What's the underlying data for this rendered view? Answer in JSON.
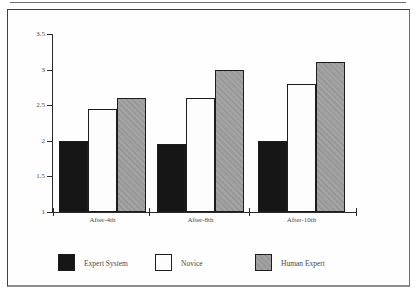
{
  "figure": {
    "background": "#fefefe",
    "frame_border_color": "#3f3f3f"
  },
  "chart_data": {
    "type": "bar",
    "title": "",
    "xlabel": "",
    "ylabel": "",
    "categories": [
      "After-4th",
      "After-8th",
      "After-10th"
    ],
    "series": [
      {
        "name": "Expert System",
        "color": "#161616",
        "values": [
          2.0,
          1.95,
          2.0
        ]
      },
      {
        "name": "Novice",
        "color": "#fdfdfd",
        "values": [
          2.45,
          2.6,
          2.8
        ]
      },
      {
        "name": "Human Expert",
        "color": "#9c9c9c",
        "values": [
          2.6,
          3.0,
          3.1
        ]
      }
    ],
    "ylim": [
      1,
      3.5
    ],
    "yticks": [
      1,
      1.5,
      2,
      2.5,
      3,
      3.5
    ],
    "ytick_labels": [
      "1",
      "1.5",
      "2",
      "2.5",
      "3",
      "3.5"
    ],
    "grid": false,
    "legend_position": "bottom"
  },
  "legend": {
    "items": [
      {
        "label": "Expert System",
        "color": "#161616"
      },
      {
        "label": "Novice",
        "color": "#fdfdfd"
      },
      {
        "label": "Human Expert",
        "color": "#9c9c9c"
      }
    ]
  }
}
